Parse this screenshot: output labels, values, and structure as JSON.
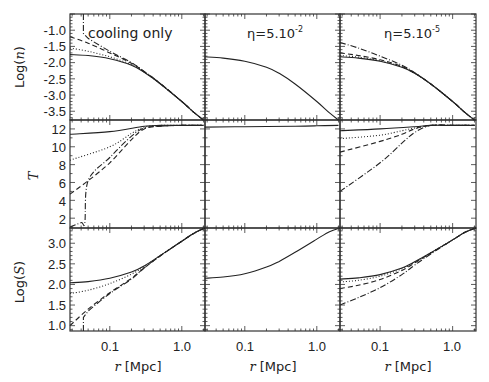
{
  "figure": {
    "columns": [
      {
        "title": "cooling only"
      },
      {
        "title": "η=5.10",
        "title_exp": "-2"
      },
      {
        "title": "η=5.10",
        "title_exp": "-5"
      }
    ],
    "rows": [
      {
        "ylabel": "Log(n)",
        "ylabel_parts": [
          "Log(",
          "n",
          ")"
        ],
        "yticks": [
          "-1.0",
          "-1.5",
          "-2.0",
          "-2.5",
          "-3.0",
          "-3.5"
        ]
      },
      {
        "ylabel": "T",
        "yticks": [
          "12",
          "10",
          "8",
          "6",
          "4",
          "2"
        ]
      },
      {
        "ylabel": "Log(S)",
        "ylabel_parts": [
          "Log(",
          "S",
          ")"
        ],
        "yticks": [
          "3.0",
          "2.5",
          "2.0",
          "1.5",
          "1.0"
        ]
      }
    ],
    "xlabel": "r [Mpc]",
    "xlabel_parts": [
      "r",
      " [Mpc]"
    ],
    "xticks": [
      "0.1",
      "1.0"
    ]
  },
  "chart_data": {
    "type": "line",
    "layout": "3x3 grid of panels, shared log x-axis, shared y per row",
    "xlabel": "r [Mpc]",
    "xscale": "log",
    "xlim": [
      0.028,
      2.1
    ],
    "xticks": [
      0.1,
      1.0
    ],
    "line_styles": [
      "solid",
      "dotted",
      "dashed",
      "dash-dot"
    ],
    "panels": [
      {
        "row": 0,
        "col": 0,
        "title": "cooling only",
        "ylabel": "Log(n)",
        "ylim": [
          -3.77,
          -0.5
        ],
        "series": [
          {
            "style": "solid",
            "x": [
              0.028,
              0.05,
              0.1,
              0.2,
              0.3,
              0.5,
              1.0,
              1.5,
              2.0
            ],
            "y": [
              -1.75,
              -1.78,
              -1.88,
              -2.08,
              -2.3,
              -2.65,
              -3.2,
              -3.55,
              -3.77
            ]
          },
          {
            "style": "dotted",
            "x": [
              0.028,
              0.05,
              0.1,
              0.2,
              0.3,
              0.5,
              1.0,
              1.5,
              2.0
            ],
            "y": [
              -1.55,
              -1.65,
              -1.82,
              -2.06,
              -2.29,
              -2.65,
              -3.2,
              -3.55,
              -3.77
            ]
          },
          {
            "style": "dashed",
            "x": [
              0.028,
              0.05,
              0.1,
              0.2,
              0.3,
              0.5,
              1.0,
              1.5,
              2.0
            ],
            "y": [
              -1.2,
              -1.4,
              -1.7,
              -2.02,
              -2.28,
              -2.64,
              -3.2,
              -3.55,
              -3.77
            ]
          },
          {
            "style": "dash-dot",
            "x": [
              0.043,
              0.043,
              0.05,
              0.1,
              0.2,
              0.3,
              0.5,
              1.0,
              1.5,
              2.0
            ],
            "y": [
              -0.5,
              -1.1,
              -1.25,
              -1.65,
              -2.0,
              -2.27,
              -2.64,
              -3.2,
              -3.55,
              -3.77
            ]
          }
        ]
      },
      {
        "row": 0,
        "col": 1,
        "title": "η=5.10^-2",
        "ylabel": "Log(n)",
        "ylim": [
          -3.77,
          -0.5
        ],
        "series": [
          {
            "style": "solid",
            "x": [
              0.028,
              0.05,
              0.1,
              0.2,
              0.3,
              0.5,
              1.0,
              1.5,
              2.0
            ],
            "y": [
              -1.82,
              -1.86,
              -1.96,
              -2.14,
              -2.33,
              -2.66,
              -3.2,
              -3.55,
              -3.77
            ]
          }
        ]
      },
      {
        "row": 0,
        "col": 2,
        "title": "η=5.10^-5",
        "ylabel": "Log(n)",
        "ylim": [
          -3.77,
          -0.5
        ],
        "series": [
          {
            "style": "solid",
            "x": [
              0.028,
              0.05,
              0.1,
              0.2,
              0.3,
              0.5,
              1.0,
              1.5,
              2.0
            ],
            "y": [
              -1.82,
              -1.86,
              -1.96,
              -2.14,
              -2.33,
              -2.66,
              -3.2,
              -3.55,
              -3.77
            ]
          },
          {
            "style": "dotted",
            "x": [
              0.028,
              0.05,
              0.1,
              0.2,
              0.3,
              0.5,
              1.0,
              1.5,
              2.0
            ],
            "y": [
              -1.78,
              -1.83,
              -1.94,
              -2.13,
              -2.33,
              -2.66,
              -3.2,
              -3.55,
              -3.77
            ]
          },
          {
            "style": "dashed",
            "x": [
              0.028,
              0.05,
              0.1,
              0.2,
              0.3,
              0.5,
              1.0,
              1.5,
              2.0
            ],
            "y": [
              -1.7,
              -1.78,
              -1.91,
              -2.12,
              -2.32,
              -2.66,
              -3.2,
              -3.55,
              -3.77
            ]
          },
          {
            "style": "dash-dot",
            "x": [
              0.028,
              0.05,
              0.1,
              0.2,
              0.3,
              0.5,
              1.0,
              1.5,
              2.0
            ],
            "y": [
              -1.38,
              -1.55,
              -1.8,
              -2.08,
              -2.31,
              -2.66,
              -3.2,
              -3.55,
              -3.77
            ]
          }
        ]
      },
      {
        "row": 1,
        "col": 0,
        "title": "cooling only",
        "ylabel": "T",
        "ylim": [
          0.9,
          13.0
        ],
        "series": [
          {
            "style": "solid",
            "x": [
              0.028,
              0.1,
              0.3,
              0.5,
              1.0,
              2.0
            ],
            "y": [
              11.4,
              11.7,
              12.3,
              12.4,
              12.4,
              12.4
            ]
          },
          {
            "style": "dotted",
            "x": [
              0.028,
              0.1,
              0.2,
              0.3,
              0.5,
              1.0,
              2.0
            ],
            "y": [
              8.5,
              10.0,
              11.5,
              12.2,
              12.4,
              12.4,
              12.4
            ]
          },
          {
            "style": "dashed",
            "x": [
              0.028,
              0.05,
              0.1,
              0.2,
              0.3,
              0.5,
              1.0,
              2.0
            ],
            "y": [
              4.7,
              6.2,
              8.2,
              10.8,
              12.0,
              12.3,
              12.4,
              12.4
            ]
          },
          {
            "style": "dash-dot",
            "x": [
              0.028,
              0.04,
              0.045,
              0.05,
              0.1,
              0.2,
              0.3,
              0.5,
              1.0,
              2.0
            ],
            "y": [
              1.0,
              1.5,
              1.5,
              6.2,
              8.8,
              11.2,
              12.1,
              12.3,
              12.4,
              12.4
            ]
          }
        ]
      },
      {
        "row": 1,
        "col": 1,
        "title": "η=5.10^-2",
        "ylabel": "T",
        "ylim": [
          0.9,
          13.0
        ],
        "series": [
          {
            "style": "solid",
            "x": [
              0.028,
              0.1,
              0.5,
              1.0,
              2.0
            ],
            "y": [
              12.2,
              12.25,
              12.3,
              12.35,
              12.4
            ]
          }
        ]
      },
      {
        "row": 1,
        "col": 2,
        "title": "η=5.10^-5",
        "ylabel": "T",
        "ylim": [
          0.9,
          13.0
        ],
        "series": [
          {
            "style": "solid",
            "x": [
              0.028,
              0.1,
              0.3,
              0.5,
              1.0,
              2.0
            ],
            "y": [
              11.8,
              12.0,
              12.25,
              12.4,
              12.4,
              12.4
            ]
          },
          {
            "style": "dotted",
            "x": [
              0.028,
              0.1,
              0.2,
              0.3,
              0.5,
              1.0,
              2.0
            ],
            "y": [
              10.9,
              11.3,
              11.8,
              12.1,
              12.4,
              12.4,
              12.4
            ]
          },
          {
            "style": "dashed",
            "x": [
              0.028,
              0.1,
              0.2,
              0.3,
              0.5,
              1.0,
              2.0
            ],
            "y": [
              9.4,
              10.6,
              11.4,
              12.0,
              12.4,
              12.4,
              12.4
            ]
          },
          {
            "style": "dash-dot",
            "x": [
              0.028,
              0.1,
              0.2,
              0.3,
              0.5,
              1.0,
              2.0
            ],
            "y": [
              5.0,
              8.2,
              10.4,
              11.6,
              12.4,
              12.4,
              12.4
            ]
          }
        ]
      },
      {
        "row": 2,
        "col": 0,
        "title": "cooling only",
        "ylabel": "Log(S)",
        "ylim": [
          0.87,
          3.37
        ],
        "series": [
          {
            "style": "solid",
            "x": [
              0.028,
              0.05,
              0.1,
              0.2,
              0.3,
              0.5,
              1.0,
              1.5,
              2.1
            ],
            "y": [
              2.04,
              2.07,
              2.15,
              2.3,
              2.45,
              2.7,
              3.05,
              3.25,
              3.37
            ]
          },
          {
            "style": "dotted",
            "x": [
              0.028,
              0.05,
              0.1,
              0.2,
              0.3,
              0.5,
              1.0,
              1.5,
              2.1
            ],
            "y": [
              1.78,
              1.86,
              2.02,
              2.25,
              2.43,
              2.7,
              3.05,
              3.25,
              3.37
            ]
          },
          {
            "style": "dashed",
            "x": [
              0.028,
              0.05,
              0.1,
              0.2,
              0.3,
              0.5,
              1.0,
              1.5,
              2.1
            ],
            "y": [
              1.0,
              1.4,
              1.8,
              2.15,
              2.4,
              2.69,
              3.05,
              3.25,
              3.37
            ]
          },
          {
            "style": "dash-dot",
            "x": [
              0.043,
              0.043,
              0.05,
              0.1,
              0.2,
              0.3,
              0.5,
              1.0,
              1.5,
              2.1
            ],
            "y": [
              0.87,
              1.2,
              1.35,
              1.78,
              2.13,
              2.4,
              2.69,
              3.05,
              3.25,
              3.37
            ]
          }
        ]
      },
      {
        "row": 2,
        "col": 1,
        "title": "η=5.10^-2",
        "ylabel": "Log(S)",
        "ylim": [
          0.87,
          3.37
        ],
        "series": [
          {
            "style": "solid",
            "x": [
              0.028,
              0.05,
              0.1,
              0.2,
              0.3,
              0.5,
              1.0,
              1.5,
              2.1
            ],
            "y": [
              2.15,
              2.18,
              2.26,
              2.42,
              2.56,
              2.78,
              3.1,
              3.28,
              3.37
            ]
          }
        ]
      },
      {
        "row": 2,
        "col": 2,
        "title": "η=5.10^-5",
        "ylabel": "Log(S)",
        "ylim": [
          0.87,
          3.37
        ],
        "series": [
          {
            "style": "solid",
            "x": [
              0.028,
              0.05,
              0.1,
              0.2,
              0.3,
              0.5,
              1.0,
              1.5,
              2.1
            ],
            "y": [
              2.13,
              2.16,
              2.24,
              2.4,
              2.55,
              2.77,
              3.08,
              3.27,
              3.37
            ]
          },
          {
            "style": "dotted",
            "x": [
              0.028,
              0.05,
              0.1,
              0.2,
              0.3,
              0.5,
              1.0,
              1.5,
              2.1
            ],
            "y": [
              2.06,
              2.1,
              2.2,
              2.38,
              2.54,
              2.77,
              3.08,
              3.27,
              3.37
            ]
          },
          {
            "style": "dashed",
            "x": [
              0.028,
              0.05,
              0.1,
              0.2,
              0.3,
              0.5,
              1.0,
              1.5,
              2.1
            ],
            "y": [
              1.9,
              1.98,
              2.12,
              2.34,
              2.52,
              2.76,
              3.08,
              3.27,
              3.37
            ]
          },
          {
            "style": "dash-dot",
            "x": [
              0.028,
              0.05,
              0.1,
              0.2,
              0.3,
              0.5,
              1.0,
              1.5,
              2.1
            ],
            "y": [
              1.5,
              1.68,
              1.92,
              2.24,
              2.47,
              2.74,
              3.08,
              3.27,
              3.37
            ]
          }
        ]
      }
    ]
  }
}
